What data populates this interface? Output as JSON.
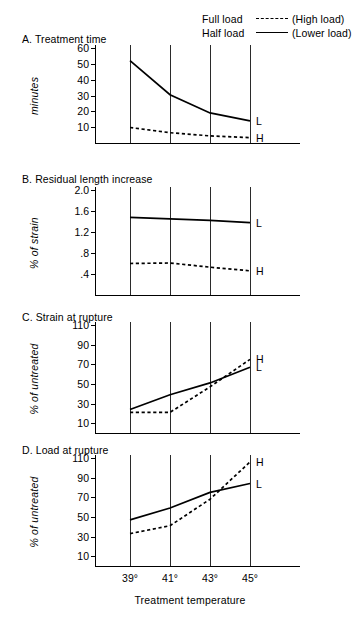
{
  "legend": {
    "rows": [
      {
        "label": "Full load",
        "style": "dashed",
        "paren": "(High load)"
      },
      {
        "label": "Half load",
        "style": "solid",
        "paren": "(Lower load)"
      }
    ]
  },
  "axis": {
    "x_title": "Treatment temperature",
    "x_ticks": [
      "39°",
      "41°",
      "43°",
      "45°"
    ],
    "x_values": [
      39,
      41,
      43,
      45
    ]
  },
  "series_labels": {
    "solid": "L",
    "dashed": "H"
  },
  "chart_data": [
    {
      "type": "line",
      "panel": "A",
      "title": "A.  Treatment time",
      "ylabel": "minutes",
      "xlabel": "Treatment temperature",
      "categories": [
        "39°",
        "41°",
        "43°",
        "45°"
      ],
      "x": [
        39,
        41,
        43,
        45
      ],
      "yticks": [
        10,
        20,
        30,
        40,
        50,
        60
      ],
      "ylim": [
        0,
        60
      ],
      "grid": true,
      "legend_position": "top-right",
      "series": [
        {
          "name": "Half load (Lower load)",
          "style": "solid",
          "end_label": "L",
          "values": [
            52,
            30.5,
            19,
            14
          ]
        },
        {
          "name": "Full load (High load)",
          "style": "dashed",
          "end_label": "H",
          "values": [
            9.8,
            6.5,
            4.5,
            3.4
          ]
        }
      ]
    },
    {
      "type": "line",
      "panel": "B",
      "title": "B.  Residual length increase",
      "ylabel": "% of strain",
      "xlabel": "Treatment temperature",
      "categories": [
        "39°",
        "41°",
        "43°",
        "45°"
      ],
      "x": [
        39,
        41,
        43,
        45
      ],
      "yticks": [
        0.4,
        0.8,
        1.2,
        1.6,
        2.0
      ],
      "ytick_labels": [
        ".4",
        ".8",
        "1.2",
        "1.6",
        "2.0"
      ],
      "ylim": [
        0,
        2.0
      ],
      "grid": true,
      "series": [
        {
          "name": "Half load (Lower load)",
          "style": "solid",
          "end_label": "L",
          "values": [
            1.48,
            1.45,
            1.42,
            1.38
          ]
        },
        {
          "name": "Full load (High load)",
          "style": "dashed",
          "end_label": "H",
          "values": [
            0.6,
            0.61,
            0.53,
            0.46
          ]
        }
      ]
    },
    {
      "type": "line",
      "panel": "C",
      "title": "C.  Strain at rupture",
      "ylabel": "% of untreated",
      "xlabel": "Treatment temperature",
      "categories": [
        "39°",
        "41°",
        "43°",
        "45°"
      ],
      "x": [
        39,
        41,
        43,
        45
      ],
      "yticks": [
        10,
        30,
        50,
        70,
        90,
        110
      ],
      "ylim": [
        0,
        110
      ],
      "grid": true,
      "series": [
        {
          "name": "Half load (Lower load)",
          "style": "solid",
          "end_label": "L",
          "values": [
            24,
            39,
            51,
            67
          ]
        },
        {
          "name": "Full load (High load)",
          "style": "dashed",
          "end_label": "H",
          "values": [
            21,
            21,
            47,
            75
          ]
        }
      ]
    },
    {
      "type": "line",
      "panel": "D",
      "title": "D.  Load at rupture",
      "ylabel": "% of untreated",
      "xlabel": "Treatment temperature",
      "categories": [
        "39°",
        "41°",
        "43°",
        "45°"
      ],
      "x": [
        39,
        41,
        43,
        45
      ],
      "yticks": [
        10,
        30,
        50,
        70,
        90,
        110
      ],
      "ylim": [
        0,
        110
      ],
      "grid": true,
      "series": [
        {
          "name": "Half load (Lower load)",
          "style": "solid",
          "end_label": "L",
          "values": [
            47,
            59,
            75,
            84
          ]
        },
        {
          "name": "Full load (High load)",
          "style": "dashed",
          "end_label": "H",
          "values": [
            33,
            41,
            68,
            106
          ]
        }
      ]
    }
  ]
}
